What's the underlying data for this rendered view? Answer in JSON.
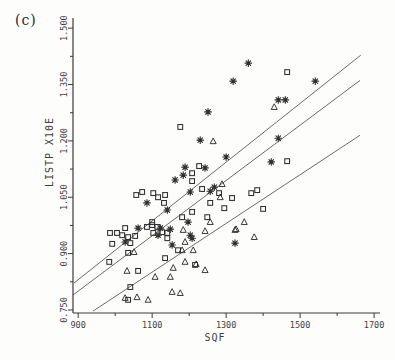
{
  "figure_label": "(c)",
  "chart_data": {
    "type": "scatter",
    "title": "",
    "xlabel": "SQF",
    "ylabel": "LISTP X10E",
    "xlim": [
      886,
      1716
    ],
    "ylim": [
      0.742,
      1.527
    ],
    "x_major_ticks": [
      900,
      1100,
      1300,
      1500,
      1700
    ],
    "x_minor_ticks": [
      1000,
      1200,
      1400,
      1600
    ],
    "y_major_ticks": [
      0.75,
      0.9,
      1.05,
      1.2,
      1.35,
      1.5
    ],
    "y_minor_ticks": [
      0.825,
      0.975,
      1.125,
      1.275,
      1.425
    ],
    "grid": false,
    "legend": "none",
    "colors": {
      "ink": "#2f2f2f",
      "line": "#5a5a5a",
      "axis": "#3a3a3a"
    },
    "series": [
      {
        "name": "squares",
        "marker": "square",
        "points": [
          [
            1465,
            1.383
          ],
          [
            1176,
            1.237
          ],
          [
            1465,
            1.146
          ],
          [
            1227,
            1.133
          ],
          [
            1208,
            1.114
          ],
          [
            1208,
            1.093
          ],
          [
            1235,
            1.072
          ],
          [
            1281,
            1.061
          ],
          [
            1316,
            1.048
          ],
          [
            1295,
            1.021
          ],
          [
            1368,
            1.061
          ],
          [
            1384,
            1.069
          ],
          [
            1400,
            1.019
          ],
          [
            1257,
            1.035
          ],
          [
            1132,
            1.035
          ],
          [
            1057,
            1.056
          ],
          [
            1073,
            1.064
          ],
          [
            1103,
            1.061
          ],
          [
            1116,
            1.05
          ],
          [
            1135,
            1.056
          ],
          [
            1208,
            1.011
          ],
          [
            1181,
            0.997
          ],
          [
            1249,
            0.997
          ],
          [
            1100,
            0.984
          ],
          [
            1027,
            0.968
          ],
          [
            1086,
            0.971
          ],
          [
            1100,
            0.976
          ],
          [
            1114,
            0.971
          ],
          [
            1127,
            0.957
          ],
          [
            1141,
            0.955
          ],
          [
            1019,
            0.949
          ],
          [
            1035,
            0.944
          ],
          [
            1054,
            0.947
          ],
          [
            986,
            0.955
          ],
          [
            1005,
            0.955
          ],
          [
            1041,
            0.928
          ],
          [
            1103,
            0.955
          ],
          [
            1141,
            0.941
          ],
          [
            1170,
            0.909
          ],
          [
            992,
            0.926
          ],
          [
            1035,
            0.902
          ],
          [
            1135,
            0.888
          ],
          [
            1216,
            0.87
          ],
          [
            984,
            0.878
          ],
          [
            1062,
            0.854
          ],
          [
            1041,
            0.811
          ],
          [
            1035,
            0.777
          ]
        ]
      },
      {
        "name": "asterisks",
        "marker": "asterisk",
        "points": [
          [
            1360,
            1.407
          ],
          [
            1319,
            1.359
          ],
          [
            1541,
            1.359
          ],
          [
            1251,
            1.277
          ],
          [
            1441,
            1.309
          ],
          [
            1460,
            1.309
          ],
          [
            1230,
            1.202
          ],
          [
            1441,
            1.207
          ],
          [
            1300,
            1.157
          ],
          [
            1422,
            1.144
          ],
          [
            1189,
            1.13
          ],
          [
            1243,
            1.128
          ],
          [
            1184,
            1.109
          ],
          [
            1162,
            1.096
          ],
          [
            1203,
            1.064
          ],
          [
            1257,
            1.066
          ],
          [
            1268,
            1.077
          ],
          [
            1086,
            1.035
          ],
          [
            1141,
            1.016
          ],
          [
            1197,
            0.984
          ],
          [
            1062,
            0.968
          ],
          [
            1149,
            0.965
          ],
          [
            1203,
            0.949
          ],
          [
            1122,
            0.968
          ],
          [
            1154,
            0.923
          ],
          [
            1208,
            0.941
          ],
          [
            1324,
            0.928
          ],
          [
            1027,
            0.931
          ],
          [
            1116,
            0.949
          ]
        ]
      },
      {
        "name": "triangles",
        "marker": "triangle",
        "points": [
          [
            1430,
            1.29
          ],
          [
            1265,
            1.199
          ],
          [
            1289,
            1.085
          ],
          [
            1284,
            1.05
          ],
          [
            1257,
            0.984
          ],
          [
            1184,
            0.963
          ],
          [
            1243,
            0.96
          ],
          [
            1324,
            0.963
          ],
          [
            1349,
            0.984
          ],
          [
            1327,
            0.965
          ],
          [
            1376,
            0.944
          ],
          [
            1189,
            0.931
          ],
          [
            1181,
            0.909
          ],
          [
            1211,
            0.909
          ],
          [
            1051,
            0.904
          ],
          [
            1189,
            0.878
          ],
          [
            1157,
            0.862
          ],
          [
            1243,
            0.856
          ],
          [
            1149,
            0.838
          ],
          [
            1032,
            0.854
          ],
          [
            1108,
            0.838
          ],
          [
            1027,
            0.782
          ],
          [
            1059,
            0.784
          ],
          [
            1089,
            0.777
          ],
          [
            1154,
            0.798
          ],
          [
            1176,
            0.795
          ],
          [
            1219,
            0.872
          ]
        ]
      }
    ],
    "lines": [
      {
        "name": "upper-fit-line",
        "x1": 889,
        "y1": 0.822,
        "x2": 1664,
        "y2": 1.428
      },
      {
        "name": "middle-fit-line",
        "x1": 886,
        "y1": 0.79,
        "x2": 1662,
        "y2": 1.361
      },
      {
        "name": "lower-fit-line",
        "x1": 940,
        "y1": 0.747,
        "x2": 1662,
        "y2": 1.215
      }
    ]
  }
}
